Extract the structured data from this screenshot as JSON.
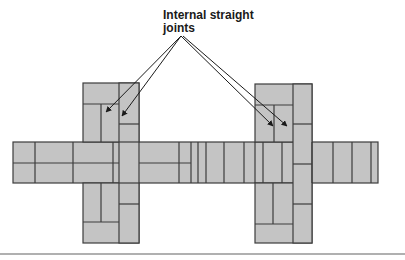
{
  "annotation": {
    "line1": "Internal straight",
    "line2": "joints"
  },
  "colors": {
    "brick_fill": "#c4c4c4",
    "joint_line": "#3c3c3c",
    "arrow": "#1a1a1a",
    "rule": "#b0b0b0",
    "background": "#ffffff"
  }
}
